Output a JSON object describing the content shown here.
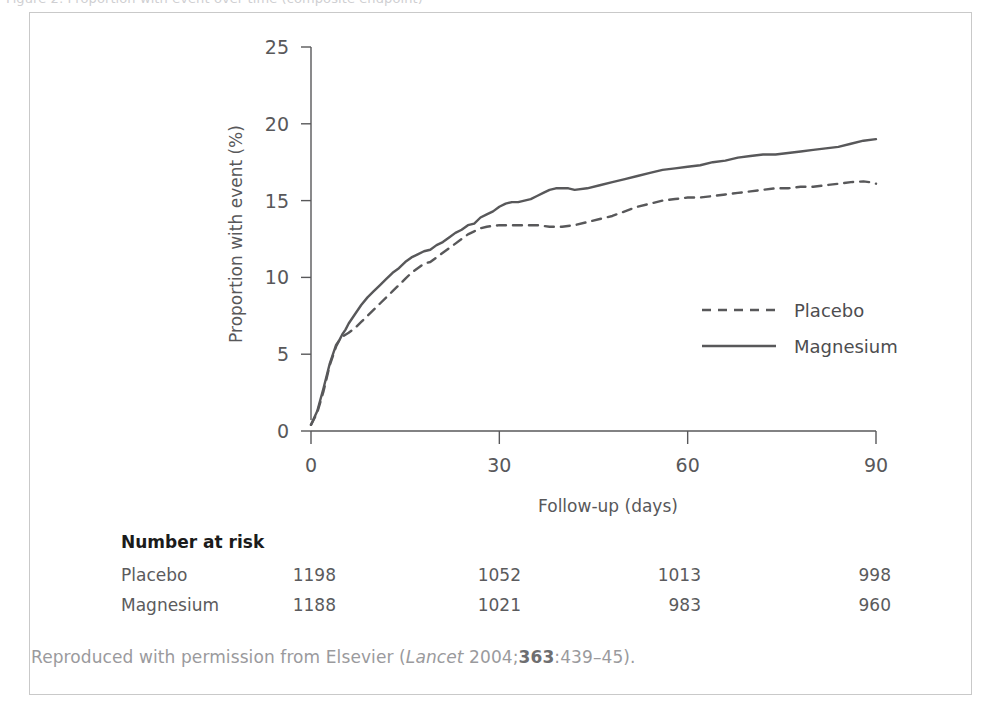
{
  "top_clipped_text": "Figure 2: Proportion with event over time (composite endpoint)",
  "figure": {
    "caption": {
      "prefix": "Reproduced with permission from Elsevier (",
      "journal": "Lancet",
      "year": " 2004;",
      "volume": "363",
      "pages": ":439–45).",
      "full_text": "Reproduced with permission from Elsevier (Lancet 2004;363:439–45)."
    }
  },
  "chart_data": {
    "type": "line",
    "title": "",
    "xlabel": "Follow-up (days)",
    "ylabel": "Proportion with event (%)",
    "xlim": [
      0,
      90
    ],
    "ylim": [
      0,
      25
    ],
    "xticks": [
      0,
      30,
      60,
      90
    ],
    "yticks": [
      0,
      5,
      10,
      15,
      20,
      25
    ],
    "grid": false,
    "legend_position": "center-right",
    "series": [
      {
        "name": "Placebo",
        "style": "dashed",
        "color": "#58585a",
        "points": [
          [
            0.0,
            0.4
          ],
          [
            1.0,
            1.2
          ],
          [
            2.0,
            2.6
          ],
          [
            3.0,
            4.3
          ],
          [
            4.0,
            5.5
          ],
          [
            4.5,
            5.9
          ],
          [
            5.2,
            6.2
          ],
          [
            6.0,
            6.4
          ],
          [
            7.0,
            6.7
          ],
          [
            8.0,
            7.1
          ],
          [
            9.0,
            7.5
          ],
          [
            10.0,
            7.9
          ],
          [
            11.0,
            8.3
          ],
          [
            12.0,
            8.7
          ],
          [
            13.0,
            9.1
          ],
          [
            14.0,
            9.5
          ],
          [
            15.0,
            9.9
          ],
          [
            16.0,
            10.3
          ],
          [
            17.0,
            10.6
          ],
          [
            18.0,
            10.9
          ],
          [
            19.0,
            11.0
          ],
          [
            20.0,
            11.3
          ],
          [
            21.0,
            11.6
          ],
          [
            22.0,
            11.9
          ],
          [
            23.0,
            12.2
          ],
          [
            24.0,
            12.5
          ],
          [
            25.0,
            12.8
          ],
          [
            26.0,
            13.0
          ],
          [
            27.0,
            13.2
          ],
          [
            28.0,
            13.3
          ],
          [
            30.0,
            13.4
          ],
          [
            32.0,
            13.4
          ],
          [
            34.0,
            13.4
          ],
          [
            36.0,
            13.4
          ],
          [
            38.0,
            13.3
          ],
          [
            40.0,
            13.3
          ],
          [
            42.0,
            13.4
          ],
          [
            44.0,
            13.6
          ],
          [
            46.0,
            13.8
          ],
          [
            48.0,
            14.0
          ],
          [
            50.0,
            14.3
          ],
          [
            52.0,
            14.6
          ],
          [
            54.0,
            14.8
          ],
          [
            56.0,
            15.0
          ],
          [
            58.0,
            15.1
          ],
          [
            60.0,
            15.2
          ],
          [
            62.0,
            15.2
          ],
          [
            64.0,
            15.3
          ],
          [
            66.0,
            15.4
          ],
          [
            68.0,
            15.5
          ],
          [
            70.0,
            15.6
          ],
          [
            72.0,
            15.7
          ],
          [
            74.0,
            15.8
          ],
          [
            76.0,
            15.8
          ],
          [
            78.0,
            15.9
          ],
          [
            80.0,
            15.9
          ],
          [
            82.0,
            16.0
          ],
          [
            84.0,
            16.1
          ],
          [
            86.0,
            16.2
          ],
          [
            88.0,
            16.25
          ],
          [
            89.0,
            16.2
          ],
          [
            90.0,
            16.1
          ]
        ]
      },
      {
        "name": "Magnesium",
        "style": "solid",
        "color": "#58585a",
        "points": [
          [
            0.0,
            0.4
          ],
          [
            1.0,
            1.3
          ],
          [
            2.0,
            2.8
          ],
          [
            3.0,
            4.4
          ],
          [
            4.0,
            5.6
          ],
          [
            4.5,
            5.9
          ],
          [
            5.0,
            6.3
          ],
          [
            5.5,
            6.6
          ],
          [
            6.0,
            7.0
          ],
          [
            7.0,
            7.6
          ],
          [
            8.0,
            8.2
          ],
          [
            9.0,
            8.7
          ],
          [
            10.0,
            9.1
          ],
          [
            11.0,
            9.5
          ],
          [
            12.0,
            9.9
          ],
          [
            13.0,
            10.3
          ],
          [
            14.0,
            10.6
          ],
          [
            15.0,
            11.0
          ],
          [
            16.0,
            11.3
          ],
          [
            17.0,
            11.5
          ],
          [
            18.0,
            11.7
          ],
          [
            19.0,
            11.8
          ],
          [
            20.0,
            12.1
          ],
          [
            21.0,
            12.3
          ],
          [
            22.0,
            12.6
          ],
          [
            23.0,
            12.9
          ],
          [
            24.0,
            13.1
          ],
          [
            25.0,
            13.4
          ],
          [
            26.0,
            13.5
          ],
          [
            27.0,
            13.9
          ],
          [
            28.0,
            14.1
          ],
          [
            29.0,
            14.3
          ],
          [
            30.0,
            14.6
          ],
          [
            31.0,
            14.8
          ],
          [
            32.0,
            14.9
          ],
          [
            33.0,
            14.9
          ],
          [
            34.0,
            15.0
          ],
          [
            35.0,
            15.1
          ],
          [
            36.0,
            15.3
          ],
          [
            37.0,
            15.5
          ],
          [
            38.0,
            15.7
          ],
          [
            39.0,
            15.8
          ],
          [
            40.0,
            15.8
          ],
          [
            41.0,
            15.8
          ],
          [
            42.0,
            15.7
          ],
          [
            44.0,
            15.8
          ],
          [
            46.0,
            16.0
          ],
          [
            48.0,
            16.2
          ],
          [
            50.0,
            16.4
          ],
          [
            52.0,
            16.6
          ],
          [
            54.0,
            16.8
          ],
          [
            56.0,
            17.0
          ],
          [
            58.0,
            17.1
          ],
          [
            60.0,
            17.2
          ],
          [
            62.0,
            17.3
          ],
          [
            64.0,
            17.5
          ],
          [
            66.0,
            17.6
          ],
          [
            68.0,
            17.8
          ],
          [
            70.0,
            17.9
          ],
          [
            72.0,
            18.0
          ],
          [
            74.0,
            18.0
          ],
          [
            76.0,
            18.1
          ],
          [
            78.0,
            18.2
          ],
          [
            80.0,
            18.3
          ],
          [
            82.0,
            18.4
          ],
          [
            84.0,
            18.5
          ],
          [
            86.0,
            18.7
          ],
          [
            88.0,
            18.9
          ],
          [
            90.0,
            19.0
          ]
        ]
      }
    ]
  },
  "risk_table": {
    "heading": "Number at risk",
    "times": [
      0,
      30,
      60,
      90
    ],
    "rows": [
      {
        "label": "Placebo",
        "values": [
          "1198",
          "1052",
          "1013",
          "998"
        ]
      },
      {
        "label": "Magnesium",
        "values": [
          "1188",
          "1021",
          "983",
          "960"
        ]
      }
    ]
  },
  "colors": {
    "line": "#58585a",
    "axis": "#58585a",
    "frame": "#c9c9c9",
    "text_muted": "#9a9a9d",
    "text_dark": "#1b1b1b"
  }
}
